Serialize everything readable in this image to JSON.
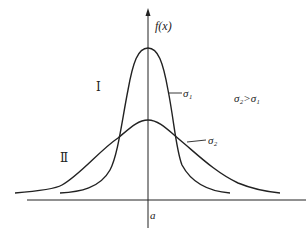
{
  "figure": {
    "y_axis_label": "f(x)",
    "x_axis_tick_label": "a",
    "region_labels": [
      "Ⅰ",
      "Ⅱ"
    ],
    "curve_labels": {
      "narrow": "σ₁",
      "wide": "σ₂"
    },
    "annotation": "σ₂>σ₁",
    "colors": {
      "stroke": "#222222",
      "background": "#ffffff"
    }
  }
}
